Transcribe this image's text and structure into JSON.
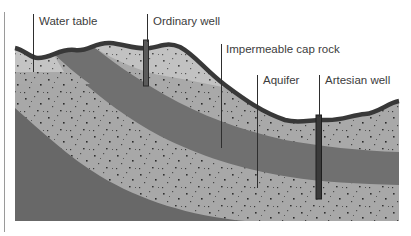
{
  "diagram": {
    "type": "cross-section",
    "labels": [
      {
        "id": "water_table",
        "text": "Water table"
      },
      {
        "id": "ordinary_well",
        "text": "Ordinary well"
      },
      {
        "id": "cap_rock",
        "text": "Impermeable cap rock"
      },
      {
        "id": "aquifer",
        "text": "Aquifer"
      },
      {
        "id": "artesian_well",
        "text": "Artesian well"
      }
    ],
    "layers": [
      {
        "name": "unsaturated-zone",
        "color": "#c7c7c7"
      },
      {
        "name": "saturated-permeable-rock",
        "color": "#a9a9a9"
      },
      {
        "name": "impermeable-cap-rock",
        "color": "#707070"
      },
      {
        "name": "aquifer",
        "color": "#a8a8a8"
      },
      {
        "name": "impermeable-base-rock",
        "color": "#686868"
      }
    ],
    "colors": {
      "ground_surface": "#383838",
      "well_casing": "#5a5a5a",
      "leader_line": "#2e2e2e",
      "label_text": "#3c3c3c"
    }
  }
}
